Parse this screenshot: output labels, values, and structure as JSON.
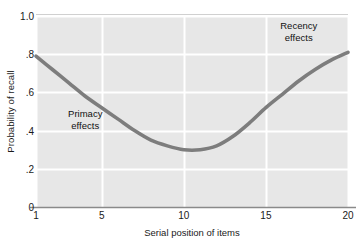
{
  "chart_data": {
    "type": "line",
    "title": "",
    "xlabel": "Serial position of items",
    "ylabel": "Probability of recall",
    "xlim": [
      1,
      20
    ],
    "ylim": [
      0,
      1.0
    ],
    "xticks": [
      "1",
      "5",
      "10",
      "15",
      "20"
    ],
    "xtick_values": [
      1,
      5,
      10,
      15,
      20
    ],
    "yticks": [
      "0",
      ".2",
      ".4",
      ".6",
      ".8",
      "1.0"
    ],
    "ytick_values": [
      0,
      0.2,
      0.4,
      0.6,
      0.8,
      1.0
    ],
    "grid": true,
    "legend": "none",
    "series": [
      {
        "name": "Serial position curve",
        "color": "#7d7d7d",
        "x": [
          1,
          2,
          3,
          4,
          5,
          6,
          7,
          8,
          9,
          10,
          11,
          12,
          13,
          14,
          15,
          16,
          17,
          18,
          19,
          20
        ],
        "values": [
          0.79,
          0.72,
          0.65,
          0.58,
          0.52,
          0.46,
          0.4,
          0.35,
          0.32,
          0.3,
          0.3,
          0.32,
          0.37,
          0.44,
          0.52,
          0.59,
          0.66,
          0.72,
          0.77,
          0.81
        ]
      }
    ],
    "annotations": [
      {
        "name": "primacy",
        "lines": [
          "Primacy",
          "effects"
        ],
        "x": 4.0,
        "y": 0.46
      },
      {
        "name": "recency",
        "lines": [
          "Recency",
          "effects"
        ],
        "x": 17.0,
        "y": 0.92
      }
    ],
    "colors": {
      "plot_background": "#e7e7e7",
      "gridline": "#ffffff",
      "curve": "#7d7d7d",
      "axis": "#8a8a8a",
      "text": "#1a1a1a"
    }
  }
}
